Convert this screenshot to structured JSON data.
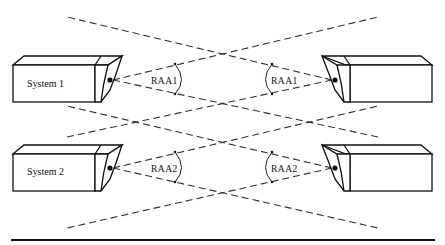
{
  "diagram": {
    "systems": [
      {
        "id": "system1-left",
        "label": "System 1",
        "side": "left",
        "lens": [
          112,
          80
        ]
      },
      {
        "id": "system1-right",
        "label": "",
        "side": "right",
        "lens": [
          333,
          80
        ]
      },
      {
        "id": "system2-left",
        "label": "System 2",
        "side": "left",
        "lens": [
          112,
          168
        ]
      },
      {
        "id": "system2-right",
        "label": "",
        "side": "right",
        "lens": [
          333,
          168
        ]
      }
    ],
    "angle_labels": {
      "raa1_left": "RAA1",
      "raa1_right": "RAA1",
      "raa2_left": "RAA2",
      "raa2_right": "RAA2"
    },
    "colors": {
      "line": "#333333",
      "outline": "#111111",
      "background": "#ffffff"
    }
  }
}
